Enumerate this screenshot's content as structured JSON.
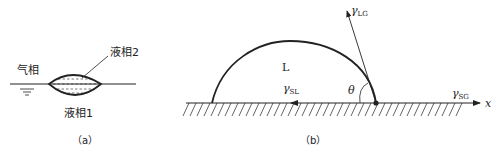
{
  "figure_a": {
    "gas_phase_label": "气相",
    "liquid2_label": "液相2",
    "liquid1_label": "液相1",
    "caption": "（a）"
  },
  "figure_b": {
    "liquid_label": "L",
    "gamma_lg": "γ",
    "gamma_lg_sub": "LG",
    "gamma_sl": "γ",
    "gamma_sl_sub": "SL",
    "gamma_sg": "γ",
    "gamma_sg_sub": "SG",
    "angle_label": "θ",
    "axis_label": "x",
    "caption": "（b）"
  },
  "colors": {
    "line": "#222222",
    "background": "#ffffff"
  }
}
